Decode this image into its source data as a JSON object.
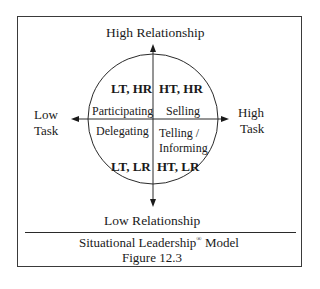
{
  "figure": {
    "axes": {
      "top_label": "High Relationship",
      "bottom_label": "Low Relationship",
      "left_label_line1": "Low",
      "left_label_line2": "Task",
      "right_label_line1": "High",
      "right_label_line2": "Task"
    },
    "quadrants": {
      "top_left": {
        "code": "LT, HR",
        "style": "Participating"
      },
      "top_right": {
        "code": "HT, HR",
        "style": "Selling"
      },
      "bottom_left": {
        "code": "LT, LR",
        "style": "Delegating"
      },
      "bottom_right": {
        "code": "HT, LR",
        "style_line1": "Telling /",
        "style_line2": "Informing"
      }
    },
    "caption": {
      "title": "Situational Leadership",
      "registered_mark": "®",
      "title_suffix": " Model",
      "figure_number": "Figure 12.3"
    },
    "colors": {
      "line": "#2a2a2a",
      "text": "#1a1a1a",
      "background": "#ffffff"
    }
  }
}
